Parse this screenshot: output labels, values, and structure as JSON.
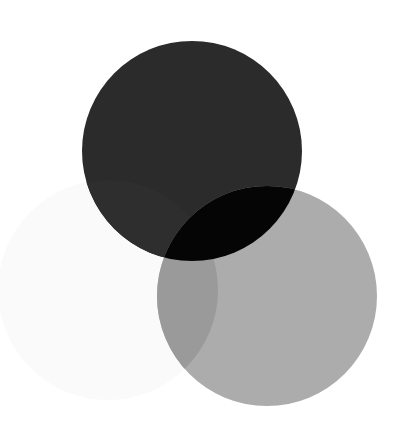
{
  "canvas": {
    "width": 408,
    "height": 429,
    "background": "#ffffff"
  },
  "circles": [
    {
      "name": "faint-circle",
      "cx": 108,
      "cy": 290,
      "r": 110,
      "color": "#fafafa"
    },
    {
      "name": "dark-circle",
      "cx": 192,
      "cy": 151,
      "r": 110,
      "color": "#2b2b2b"
    },
    {
      "name": "gray-circle",
      "cx": 267,
      "cy": 296,
      "r": 110,
      "color": "#acacac"
    }
  ],
  "overlaps": {
    "dark_gray": "#050505",
    "faint_gray": "#9a9a9a",
    "faint_dark": "#2e2e2e"
  }
}
